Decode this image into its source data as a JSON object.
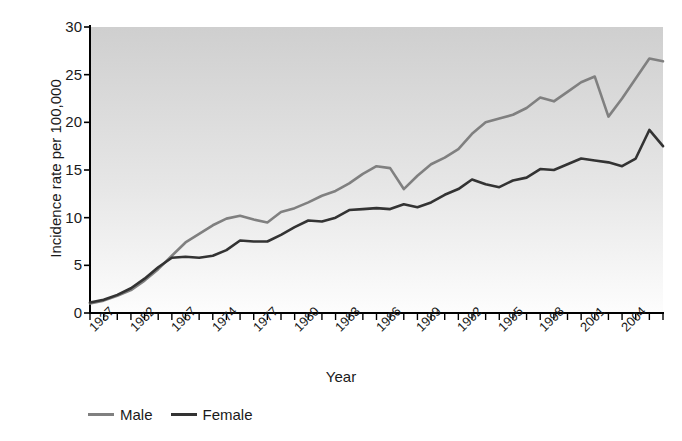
{
  "chart_data": {
    "type": "line",
    "title": "",
    "xlabel": "Year",
    "ylabel": "Incidence rate per 100,000",
    "ylim": [
      0,
      30
    ],
    "yticks": [
      0,
      5,
      10,
      15,
      20,
      25,
      30
    ],
    "grid": false,
    "legend_position": "bottom-left",
    "x": [
      1937,
      1942,
      1947,
      1952,
      1957,
      1962,
      1967,
      1970,
      1971,
      1972,
      1973,
      1974,
      1975,
      1976,
      1977,
      1978,
      1979,
      1980,
      1981,
      1982,
      1983,
      1984,
      1985,
      1986,
      1987,
      1988,
      1989,
      1990,
      1991,
      1992,
      1993,
      1994,
      1995,
      1996,
      1997,
      1998,
      1999,
      2000,
      2001,
      2002,
      2003,
      2004,
      2005
    ],
    "xtick_labels": [
      "1937",
      "",
      "",
      "1952",
      "",
      "",
      "1967",
      "",
      "",
      "1974",
      "",
      "",
      "1977",
      "",
      "",
      "1980",
      "",
      "",
      "1983",
      "",
      "",
      "1986",
      "",
      "",
      "1989",
      "",
      "",
      "1992",
      "",
      "",
      "1995",
      "",
      "",
      "1998",
      "",
      "",
      "2001",
      "",
      "",
      "2004",
      "",
      "",
      ""
    ],
    "xtick_labels_shown": [
      "1937",
      "1952",
      "1967",
      "1974",
      "1977",
      "1980",
      "1983",
      "1986",
      "1989",
      "1992",
      "1995",
      "1998",
      "2001",
      "2004"
    ],
    "series": [
      {
        "name": "Male",
        "color": "#808080",
        "values": [
          1.0,
          1.3,
          1.8,
          2.4,
          3.4,
          4.6,
          6.0,
          7.4,
          8.3,
          9.2,
          9.9,
          10.2,
          9.8,
          9.5,
          10.6,
          11.0,
          11.6,
          12.3,
          12.8,
          13.6,
          14.6,
          15.4,
          15.2,
          13.0,
          14.4,
          15.6,
          16.3,
          17.2,
          18.8,
          20.0,
          20.4,
          20.8,
          21.5,
          22.6,
          22.2,
          23.2,
          24.2,
          24.8,
          20.6,
          22.5,
          24.6,
          26.7,
          26.4
        ]
      },
      {
        "name": "Female",
        "color": "#333333",
        "values": [
          1.1,
          1.4,
          1.9,
          2.6,
          3.6,
          4.8,
          5.8,
          5.9,
          5.8,
          6.0,
          6.6,
          7.6,
          7.5,
          7.5,
          8.2,
          9.0,
          9.7,
          9.6,
          10.0,
          10.8,
          10.9,
          11.0,
          10.9,
          11.4,
          11.1,
          11.6,
          12.4,
          13.0,
          14.0,
          13.5,
          13.2,
          13.9,
          14.2,
          15.1,
          15.0,
          15.6,
          16.2,
          16.0,
          15.8,
          15.4,
          16.2,
          19.2,
          17.5
        ]
      }
    ]
  },
  "legend": {
    "entries": [
      {
        "label": "Male",
        "color": "#808080"
      },
      {
        "label": "Female",
        "color": "#333333"
      }
    ]
  },
  "axes": {
    "y_title": "Incidence rate per 100,000",
    "x_title": "Year"
  },
  "colors": {
    "male_line": "#808080",
    "female_line": "#333333",
    "axis": "#000000",
    "plot_bg_top": "#d0d0d0",
    "plot_bg_bottom": "#ffffff"
  }
}
